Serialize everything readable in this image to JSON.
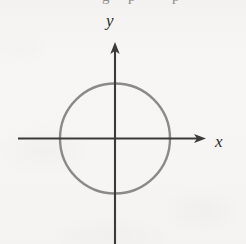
{
  "figure": {
    "background_color": "#f6f5f3",
    "axis_color": "#3a3a3a",
    "curve_color": "#8a8a8a"
  },
  "labels": {
    "y_axis": "y",
    "x_axis": "x"
  },
  "top_bleed": {
    "fragment_1": "g",
    "fragment_2": "p",
    "fragment_3": "p"
  },
  "chart_data": {
    "type": "line",
    "title": "",
    "xlabel": "x",
    "ylabel": "y",
    "grid": false,
    "legend": null,
    "axes": {
      "x": {
        "origin_px": 115,
        "start_px": 18,
        "arrow_tip_px": 206,
        "has_arrow": true,
        "has_ticks": false,
        "tick_labels": []
      },
      "y": {
        "origin_px": 138,
        "start_px": 244,
        "arrow_tip_px": 42,
        "has_arrow": true,
        "has_ticks": false,
        "tick_labels": []
      }
    },
    "series": [
      {
        "name": "circle",
        "shape": "circle",
        "center": [
          0,
          0
        ],
        "radius": 1,
        "center_px": [
          115,
          138.5
        ],
        "radius_px": 55,
        "stroke": "#8a8a8a",
        "stroke_width_px": 2.4,
        "fill": "none"
      }
    ]
  }
}
